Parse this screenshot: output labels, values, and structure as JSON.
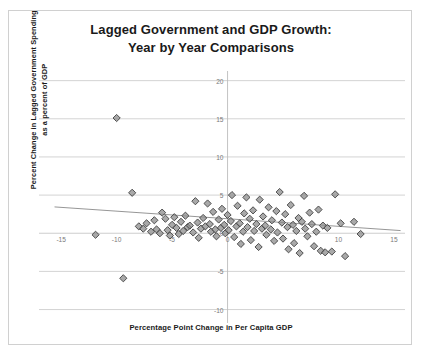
{
  "chart_data": {
    "type": "scatter",
    "title": "Lagged Government and GDP Growth:",
    "title_line2": "Year by Year Comparisons",
    "xlabel": "Percentage Point Change in Per Capita GDP",
    "ylabel": "Percent Change in Lagged Government Spending",
    "ylabel_line2": "as a percent of GDP",
    "xlim": [
      -17,
      16
    ],
    "ylim": [
      -11.5,
      21
    ],
    "xticks": [
      -15,
      -10,
      -5,
      0,
      10,
      15
    ],
    "xtick_labels": [
      "-15",
      "-10",
      "-5",
      "0",
      "10",
      "15"
    ],
    "yticks": [
      20,
      15,
      10,
      5,
      0,
      -5,
      -10
    ],
    "ytick_labels": [
      "20",
      "15",
      "10",
      "5",
      "0",
      "-5",
      "-10"
    ],
    "grid": true,
    "grid_color": "#c8c8c8",
    "legend": "none",
    "marker": "diamond",
    "marker_color": "#8c8c8c",
    "marker_edge_color": "#3f3f3f",
    "marker_size": 6,
    "trendline": {
      "visible": true,
      "color": "#8a8a8a",
      "x_start": -15.6,
      "y_start": 3.45,
      "x_end": 15.6,
      "y_end": 0.35
    },
    "points": [
      [
        -11.9,
        -0.2
      ],
      [
        -10.0,
        15.1
      ],
      [
        -9.4,
        -5.9
      ],
      [
        -8.6,
        5.3
      ],
      [
        -8.0,
        0.9
      ],
      [
        -7.6,
        0.6
      ],
      [
        -7.3,
        1.3
      ],
      [
        -6.9,
        0.2
      ],
      [
        -6.6,
        1.7
      ],
      [
        -6.4,
        0.5
      ],
      [
        -6.1,
        0.0
      ],
      [
        -5.9,
        2.7
      ],
      [
        -5.6,
        1.9
      ],
      [
        -5.4,
        0.4
      ],
      [
        -5.2,
        -0.3
      ],
      [
        -5.0,
        1.1
      ],
      [
        -4.8,
        2.1
      ],
      [
        -4.6,
        0.7
      ],
      [
        -4.4,
        -0.1
      ],
      [
        -4.2,
        1.5
      ],
      [
        -4.0,
        0.3
      ],
      [
        -3.8,
        2.3
      ],
      [
        -3.6,
        0.8
      ],
      [
        -3.4,
        1.0
      ],
      [
        -3.1,
        0.1
      ],
      [
        -2.9,
        4.2
      ],
      [
        -2.7,
        1.4
      ],
      [
        -2.6,
        -0.6
      ],
      [
        -2.4,
        0.6
      ],
      [
        -2.2,
        2.0
      ],
      [
        -2.0,
        0.9
      ],
      [
        -1.8,
        3.9
      ],
      [
        -1.6,
        1.2
      ],
      [
        -1.5,
        0.2
      ],
      [
        -1.3,
        2.8
      ],
      [
        -1.1,
        0.5
      ],
      [
        -1.0,
        -0.4
      ],
      [
        -0.8,
        1.8
      ],
      [
        -0.6,
        0.7
      ],
      [
        -0.5,
        3.2
      ],
      [
        -0.3,
        1.1
      ],
      [
        -0.2,
        0.0
      ],
      [
        0.0,
        2.4
      ],
      [
        0.1,
        0.4
      ],
      [
        0.3,
        1.6
      ],
      [
        0.4,
        5.0
      ],
      [
        0.6,
        -0.5
      ],
      [
        0.8,
        0.9
      ],
      [
        0.9,
        3.6
      ],
      [
        1.1,
        1.3
      ],
      [
        1.2,
        -1.4
      ],
      [
        1.4,
        0.2
      ],
      [
        1.5,
        2.6
      ],
      [
        1.7,
        4.7
      ],
      [
        1.8,
        0.8
      ],
      [
        2.0,
        1.9
      ],
      [
        2.1,
        -0.9
      ],
      [
        2.3,
        3.0
      ],
      [
        2.4,
        0.3
      ],
      [
        2.6,
        1.2
      ],
      [
        2.8,
        -1.8
      ],
      [
        2.9,
        4.4
      ],
      [
        3.1,
        0.6
      ],
      [
        3.2,
        2.2
      ],
      [
        3.4,
        1.0
      ],
      [
        3.5,
        -0.2
      ],
      [
        3.7,
        3.4
      ],
      [
        3.9,
        0.5
      ],
      [
        4.0,
        1.7
      ],
      [
        4.2,
        -1.0
      ],
      [
        4.4,
        2.9
      ],
      [
        4.5,
        0.1
      ],
      [
        4.7,
        5.4
      ],
      [
        4.9,
        1.4
      ],
      [
        5.0,
        -0.7
      ],
      [
        5.2,
        2.5
      ],
      [
        5.4,
        0.8
      ],
      [
        5.5,
        -2.1
      ],
      [
        5.7,
        3.7
      ],
      [
        5.9,
        1.1
      ],
      [
        6.0,
        -1.3
      ],
      [
        6.2,
        0.3
      ],
      [
        6.4,
        2.0
      ],
      [
        6.5,
        -2.6
      ],
      [
        6.7,
        1.5
      ],
      [
        6.9,
        4.9
      ],
      [
        7.0,
        0.6
      ],
      [
        7.2,
        -0.4
      ],
      [
        7.4,
        2.7
      ],
      [
        7.6,
        1.2
      ],
      [
        7.8,
        -1.7
      ],
      [
        8.0,
        0.2
      ],
      [
        8.2,
        3.1
      ],
      [
        8.4,
        -2.3
      ],
      [
        8.6,
        1.0
      ],
      [
        8.8,
        -2.5
      ],
      [
        9.0,
        0.7
      ],
      [
        9.4,
        -2.4
      ],
      [
        9.7,
        5.1
      ],
      [
        10.2,
        1.3
      ],
      [
        10.6,
        -3.0
      ],
      [
        11.4,
        1.5
      ],
      [
        12.0,
        -0.1
      ]
    ]
  }
}
